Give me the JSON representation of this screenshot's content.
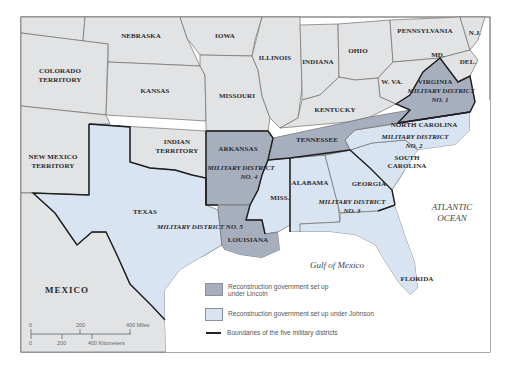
{
  "map": {
    "title": "Reconstruction Military Districts",
    "colors": {
      "union_states": "#e2e3e5",
      "lincoln": "#a7afbf",
      "johnson": "#d9e4f3",
      "water": "#ffffff",
      "district_boundary": "#1e1e1e",
      "state_border": "#6e6e6e"
    },
    "labels": {
      "nebraska": "NEBRASKA",
      "iowa": "IOWA",
      "illinois": "ILLINOIS",
      "indiana": "INDIANA",
      "ohio": "OHIO",
      "pennsylvania": "PENNSYLVANIA",
      "nj": "N.J.",
      "md": "MD.",
      "del": "DEL.",
      "colorado_1": "COLORADO",
      "colorado_2": "TERRITORY",
      "kansas": "KANSAS",
      "missouri": "MISSOURI",
      "wva": "W. VA.",
      "virginia": "VIRGINIA",
      "kentucky": "KENTUCKY",
      "indian_1": "INDIAN",
      "indian_2": "TERRITORY",
      "newmexico_1": "NEW MEXICO",
      "newmexico_2": "TERRITORY",
      "arkansas": "ARKANSAS",
      "tennessee": "TENNESSEE",
      "north_carolina": "NORTH CAROLINA",
      "south_carolina_1": "SOUTH",
      "south_carolina_2": "CAROLINA",
      "texas": "TEXAS",
      "miss": "MISS.",
      "alabama": "ALABAMA",
      "georgia": "GEORGIA",
      "louisiana": "LOUISIANA",
      "florida": "FLORIDA",
      "mexico": "MEXICO"
    },
    "districts": [
      {
        "line1": "MILITARY DISTRICT",
        "line2": "NO. 1"
      },
      {
        "line1": "MILITARY DISTRICT",
        "line2": "NO. 2"
      },
      {
        "line1": "MILITARY DISTRICT",
        "line2": "NO. 3"
      },
      {
        "line1": "MILITARY DISTRICT",
        "line2": "NO. 4"
      },
      {
        "line1": "MILITARY DISTRICT NO. 5",
        "line2": ""
      }
    ],
    "water": {
      "atlantic_1": "ATLANTIC",
      "atlantic_2": "OCEAN",
      "gulf": "Gulf of Mexico"
    },
    "scale": {
      "miles": [
        "0",
        "200",
        "400 Miles"
      ],
      "km": [
        "0",
        "200",
        "400 Kilometers"
      ]
    }
  },
  "legend": {
    "items": [
      {
        "label_1": "Reconstruction government set up",
        "label_2": "under Lincoln"
      },
      {
        "label_1": "Reconstruction government set up under Johnson"
      },
      {
        "label_1": "Boundaries of the five military districts"
      }
    ]
  }
}
